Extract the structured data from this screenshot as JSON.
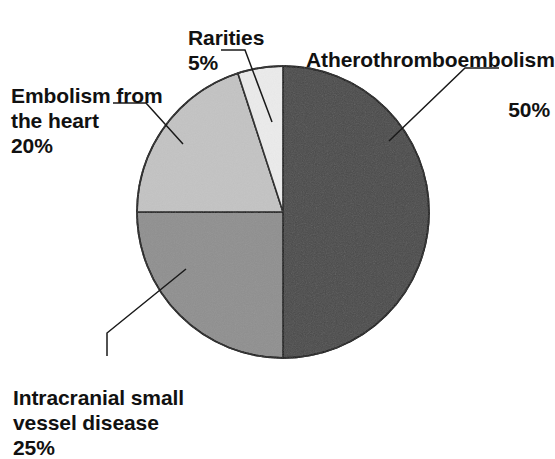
{
  "figure": {
    "background_color": "#ffffff",
    "outline_color": "#1a1a1a",
    "leader_color": "#1a1a1a"
  },
  "chart_data": {
    "type": "pie",
    "title": "",
    "subtitle": "",
    "xlabel": "",
    "ylabel": "",
    "legend_position": "none",
    "grid": false,
    "labels_inline": true,
    "start_angle_deg": 0,
    "direction": "clockwise",
    "center": {
      "x": 283,
      "y": 212
    },
    "radius": 146,
    "categories": [
      "Atherothromboembolism",
      "Intracranial small vessel disease",
      "Embolism from the heart",
      "Rarities"
    ],
    "values": [
      50,
      25,
      20,
      5
    ],
    "value_unit": "%",
    "slices": [
      {
        "label": "Atherothromboembolism",
        "value": 50,
        "value_text": "50%",
        "color": "#4a4a4a",
        "start_deg": 0,
        "end_deg": 180
      },
      {
        "label": "Intracranial small vessel disease",
        "value": 25,
        "value_text": "25%",
        "color": "#8f8f8f",
        "start_deg": 180,
        "end_deg": 270
      },
      {
        "label": "Embolism from the heart",
        "value": 20,
        "value_text": "20%",
        "color": "#c3c3c3",
        "start_deg": 270,
        "end_deg": 342
      },
      {
        "label": "Rarities",
        "value": 5,
        "value_text": "5%",
        "color": "#ebebeb",
        "start_deg": 342,
        "end_deg": 360
      }
    ]
  },
  "callouts": {
    "athero": {
      "name": "Atherothromboembolism",
      "percent": "50%"
    },
    "rarities": {
      "name": "Rarities",
      "percent": "5%"
    },
    "embolism": {
      "name": "Embolism from\nthe heart",
      "percent": "20%"
    },
    "intracranial": {
      "name": "Intracranial small\nvessel disease",
      "percent": "25%"
    }
  }
}
